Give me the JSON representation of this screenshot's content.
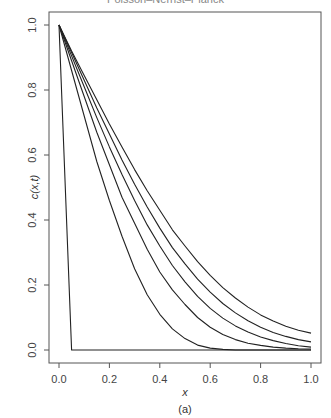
{
  "chart_data": {
    "type": "line",
    "title": "Poisson–Nernst–Planck",
    "caption": "(a)",
    "xlabel": "x",
    "ylabel": "c(x,t)",
    "xlim": [
      0.0,
      1.0
    ],
    "ylim": [
      0.0,
      1.0
    ],
    "xticks": [
      "0.0",
      "0.2",
      "0.4",
      "0.6",
      "0.8",
      "1.0"
    ],
    "yticks": [
      "0.0",
      "0.2",
      "0.4",
      "0.6",
      "0.8",
      "1.0"
    ],
    "grid": false,
    "legend": null,
    "x": [
      0.0,
      0.05,
      0.1,
      0.15,
      0.2,
      0.25,
      0.3,
      0.35,
      0.4,
      0.45,
      0.5,
      0.55,
      0.6,
      0.65,
      0.7,
      0.75,
      0.8,
      0.85,
      0.9,
      0.95,
      1.0
    ],
    "series": [
      {
        "name": "t0",
        "values": [
          1.0,
          0.0,
          0.0,
          0.0,
          0.0,
          0.0,
          0.0,
          0.0,
          0.0,
          0.0,
          0.0,
          0.0,
          0.0,
          0.0,
          0.0,
          0.0,
          0.0,
          0.0,
          0.0,
          0.0,
          0.0
        ]
      },
      {
        "name": "t1",
        "values": [
          1.0,
          0.86,
          0.72,
          0.58,
          0.46,
          0.35,
          0.25,
          0.17,
          0.11,
          0.065,
          0.035,
          0.015,
          0.006,
          0.002,
          0.0,
          0.0,
          0.0,
          0.0,
          0.0,
          0.0,
          0.0
        ]
      },
      {
        "name": "t2",
        "values": [
          1.0,
          0.89,
          0.78,
          0.67,
          0.57,
          0.47,
          0.39,
          0.31,
          0.24,
          0.185,
          0.14,
          0.1,
          0.07,
          0.048,
          0.032,
          0.021,
          0.014,
          0.009,
          0.006,
          0.004,
          0.003
        ]
      },
      {
        "name": "t3",
        "values": [
          1.0,
          0.905,
          0.81,
          0.715,
          0.625,
          0.54,
          0.46,
          0.385,
          0.32,
          0.26,
          0.21,
          0.165,
          0.128,
          0.098,
          0.074,
          0.055,
          0.04,
          0.029,
          0.02,
          0.013,
          0.009
        ]
      },
      {
        "name": "t4",
        "values": [
          1.0,
          0.915,
          0.83,
          0.745,
          0.665,
          0.585,
          0.51,
          0.44,
          0.375,
          0.315,
          0.265,
          0.218,
          0.178,
          0.143,
          0.114,
          0.09,
          0.07,
          0.054,
          0.042,
          0.032,
          0.025
        ]
      },
      {
        "name": "t5",
        "values": [
          1.0,
          0.92,
          0.845,
          0.77,
          0.695,
          0.625,
          0.555,
          0.49,
          0.43,
          0.37,
          0.32,
          0.272,
          0.23,
          0.192,
          0.16,
          0.132,
          0.108,
          0.089,
          0.073,
          0.061,
          0.052
        ]
      }
    ]
  }
}
